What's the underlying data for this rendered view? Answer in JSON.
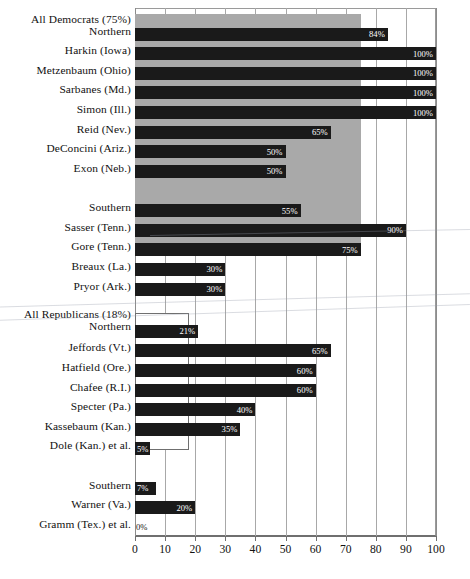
{
  "chart_data": {
    "type": "bar",
    "orientation": "horizontal",
    "title": "",
    "subtitle": "",
    "xlabel": "",
    "ylabel": "",
    "xlim": [
      0,
      100
    ],
    "xticks": [
      0,
      10,
      20,
      30,
      40,
      50,
      60,
      70,
      80,
      90,
      100
    ],
    "xtick_labels": [
      "0",
      "10",
      "20",
      "30",
      "40",
      "50",
      "60",
      "70",
      "80",
      "90",
      "100"
    ],
    "grid": true,
    "grid_axis": "x",
    "legend": "none",
    "value_label_suffix": "%",
    "bar_color": "#1a1a1a",
    "band_color": "#a9a9a9",
    "categories": [
      "All Democrats (75%)",
      "Northern",
      "Harkin (Iowa)",
      "Metzenbaum (Ohio)",
      "Sarbanes (Md.)",
      "Simon (Ill.)",
      "Reid (Nev.)",
      "DeConcini (Ariz.)",
      "Exon (Neb.)",
      "Southern",
      "Sasser (Tenn.)",
      "Gore (Tenn.)",
      "Breaux (La.)",
      "Pryor (Ark.)",
      "All Republicans (18%)",
      "Northern",
      "Jeffords (Vt.)",
      "Hatfield (Ore.)",
      "Chafee (R.I.)",
      "Specter (Pa.)",
      "Kassebaum (Kan.)",
      "Dole (Kan.) et al.",
      "Southern",
      "Warner (Va.)",
      "Gramm (Tex.) et al."
    ],
    "values": [
      75,
      84,
      100,
      100,
      100,
      100,
      65,
      50,
      50,
      55,
      90,
      75,
      30,
      30,
      18,
      21,
      65,
      60,
      60,
      40,
      35,
      5,
      7,
      20,
      0
    ],
    "value_labels": [
      "",
      "84%",
      "100%",
      "100%",
      "100%",
      "100%",
      "65%",
      "50%",
      "50%",
      "55%",
      "90%",
      "75%",
      "30%",
      "30%",
      "",
      "21%",
      "65%",
      "60%",
      "60%",
      "40%",
      "35%",
      "5%",
      "7%",
      "20%",
      "0%"
    ],
    "groups": [
      {
        "name": "All Democrats (75%)",
        "band_value": 75,
        "band_style": "filled",
        "band_color": "#a9a9a9",
        "members": [
          "Northern",
          "Harkin (Iowa)",
          "Metzenbaum (Ohio)",
          "Sarbanes (Md.)",
          "Simon (Ill.)",
          "Reid (Nev.)",
          "DeConcini (Ariz.)",
          "Exon (Neb.)",
          "Southern",
          "Sasser (Tenn.)",
          "Gore (Tenn.)",
          "Breaux (La.)",
          "Pryor (Ark.)"
        ]
      },
      {
        "name": "All Republicans (18%)",
        "band_value": 18,
        "band_style": "outlined",
        "band_color": "#ffffff",
        "members": [
          "Northern",
          "Jeffords (Vt.)",
          "Hatfield (Ore.)",
          "Chafee (R.I.)",
          "Specter (Pa.)",
          "Kassebaum (Kan.)",
          "Dole (Kan.) et al.",
          "Southern",
          "Warner (Va.)",
          "Gramm (Tex.) et al."
        ]
      }
    ]
  },
  "rows": [
    {
      "label": "All Democrats (75%)",
      "value": 75,
      "value_label": "",
      "kind": "band",
      "band_style": "filled",
      "top": 8,
      "label_top": 15,
      "height": 320
    },
    {
      "label": "Northern",
      "value": 84,
      "value_label": "84%",
      "kind": "bar",
      "top": 26,
      "label_top": 30
    },
    {
      "label": "Harkin (Iowa)",
      "value": 100,
      "value_label": "100%",
      "kind": "bar",
      "top": 52,
      "label_top": 56
    },
    {
      "label": "Metzenbaum (Ohio)",
      "value": 100,
      "value_label": "100%",
      "kind": "bar",
      "top": 78,
      "label_top": 82
    },
    {
      "label": "Sarbanes (Md.)",
      "value": 100,
      "value_label": "100%",
      "kind": "bar",
      "top": 104,
      "label_top": 108
    },
    {
      "label": "Simon (Ill.)",
      "value": 100,
      "value_label": "100%",
      "kind": "bar",
      "top": 130,
      "label_top": 134
    },
    {
      "label": "Reid (Nev.)",
      "value": 65,
      "value_label": "65%",
      "kind": "bar",
      "top": 156,
      "label_top": 160
    },
    {
      "label": "DeConcini (Ariz.)",
      "value": 50,
      "value_label": "50%",
      "kind": "bar",
      "top": 182,
      "label_top": 186
    },
    {
      "label": "Exon (Neb.)",
      "value": 50,
      "value_label": "50%",
      "kind": "bar",
      "top": 208,
      "label_top": 212
    },
    {
      "label": "Southern",
      "value": 55,
      "value_label": "55%",
      "kind": "bar",
      "top": 260,
      "label_top": 264
    },
    {
      "label": "Sasser (Tenn.)",
      "value": 90,
      "value_label": "90%",
      "kind": "bar",
      "top": 286,
      "label_top": 290
    },
    {
      "label": "Gore (Tenn.)",
      "value": 75,
      "value_label": "75%",
      "kind": "bar",
      "top": 312,
      "label_top": 316
    },
    {
      "label": "Breaux (La.)",
      "value": 30,
      "value_label": "30%",
      "kind": "bar",
      "top": 338,
      "label_top": 342
    },
    {
      "label": "Pryor (Ark.)",
      "value": 30,
      "value_label": "30%",
      "kind": "bar",
      "top": 364,
      "label_top": 368
    },
    {
      "label": "All Republicans (18%)",
      "value": 18,
      "value_label": "",
      "kind": "band",
      "band_style": "outlined",
      "top": 404,
      "label_top": 406,
      "height": 182
    },
    {
      "label": "Northern",
      "value": 21,
      "value_label": "21%",
      "kind": "bar",
      "top": 420,
      "label_top": 422
    },
    {
      "label": "Jeffords (Vt.)",
      "value": 65,
      "value_label": "65%",
      "kind": "bar",
      "top": 446,
      "label_top": 450
    },
    {
      "label": "Hatfield (Ore.)",
      "value": 60,
      "value_label": "60%",
      "kind": "bar",
      "top": 472,
      "label_top": 476
    },
    {
      "label": "Chafee (R.I.)",
      "value": 60,
      "value_label": "60%",
      "kind": "bar",
      "top": 498,
      "label_top": 502
    },
    {
      "label": "Specter (Pa.)",
      "value": 40,
      "value_label": "40%",
      "kind": "bar",
      "top": 524,
      "label_top": 528
    },
    {
      "label": "Kassebaum (Kan.)",
      "value": 35,
      "value_label": "35%",
      "kind": "bar",
      "top": 550,
      "label_top": 554
    },
    {
      "label": "Dole (Kan.) et al.",
      "value": 5,
      "value_label": "5%",
      "kind": "bar",
      "top": 576,
      "label_top": 580
    },
    {
      "label": "Southern",
      "value": 7,
      "value_label": "7%",
      "kind": "bar",
      "top": 628,
      "label_top": 632
    },
    {
      "label": "Warner (Va.)",
      "value": 20,
      "value_label": "20%",
      "kind": "bar",
      "top": 654,
      "label_top": 658
    },
    {
      "label": "Gramm (Tex.) et al.",
      "value": 0,
      "value_label": "0%",
      "kind": "bar",
      "top": 680,
      "label_top": 684
    }
  ],
  "axis": {
    "ticks": [
      "0",
      "10",
      "20",
      "30",
      "40",
      "50",
      "60",
      "70",
      "80",
      "90",
      "100"
    ]
  }
}
